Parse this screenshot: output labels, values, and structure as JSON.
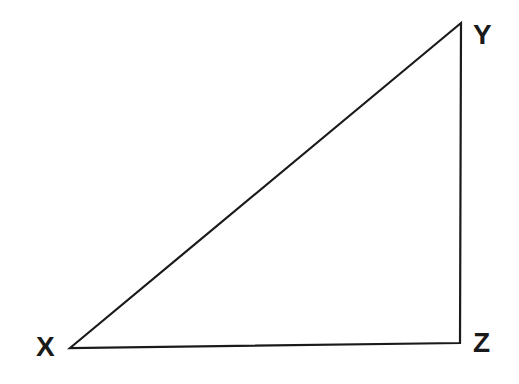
{
  "diagram": {
    "type": "right-triangle",
    "stroke_color": "#1a1a1a",
    "vertices": {
      "X": {
        "label": "X",
        "x": 70,
        "y": 348
      },
      "Y": {
        "label": "Y",
        "x": 461,
        "y": 23
      },
      "Z": {
        "label": "Z",
        "x": 460,
        "y": 343
      }
    },
    "right_angle_at": "Z"
  }
}
